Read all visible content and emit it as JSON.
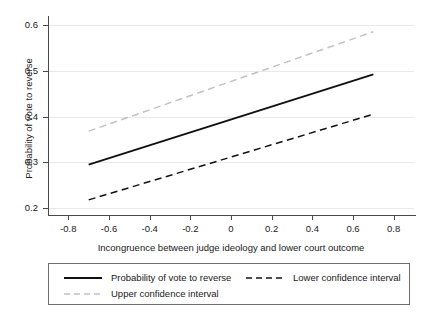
{
  "chart_data": {
    "type": "line",
    "title": "",
    "xlabel": "Incongruence between judge ideology and lower court outcome",
    "ylabel": "Probability of vote to reverse",
    "xlim": [
      -0.9,
      0.9
    ],
    "ylim": [
      0.185,
      0.615
    ],
    "xticks": [
      -0.8,
      -0.6,
      -0.4,
      -0.2,
      0,
      0.2,
      0.4,
      0.6,
      0.8
    ],
    "xtick_labels": [
      "-0.8",
      "-0.6",
      "-0.4",
      "-0.2",
      "0",
      "0.2",
      "0.4",
      "0.6",
      "0.8"
    ],
    "yticks": [
      0.2,
      0.3,
      0.4,
      0.5,
      0.6
    ],
    "ytick_labels": [
      "0.2",
      "0.3",
      "0.4",
      "0.5",
      "0.6"
    ],
    "grid": "horizontal",
    "legend_position": "below-axes",
    "x": [
      -0.7,
      0.7
    ],
    "series": [
      {
        "name": "Probability of vote to reverse",
        "values": [
          0.295,
          0.492
        ],
        "style": "solid",
        "color": "#111111",
        "width": 1.9
      },
      {
        "name": "Lower confidence interval",
        "values": [
          0.218,
          0.405
        ],
        "style": "dashed",
        "color": "#111111",
        "width": 1.5
      },
      {
        "name": "Upper confidence interval",
        "values": [
          0.368,
          0.585
        ],
        "style": "dashed",
        "color": "#c2c2c2",
        "width": 1.5
      }
    ]
  },
  "legend": {
    "entries": [
      {
        "label": "Probability of vote to reverse"
      },
      {
        "label": "Upper confidence interval"
      },
      {
        "label": "Lower confidence interval"
      }
    ]
  },
  "colors": {
    "axis": "#4a4a4a",
    "grid": "#e9e9e9",
    "text": "#1a1a1a",
    "legend_border": "#6e6e6e",
    "background": "#ffffff"
  }
}
